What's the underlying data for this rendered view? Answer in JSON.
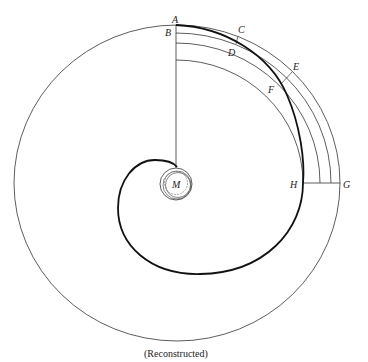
{
  "figure": {
    "caption": "(Reconstructed)",
    "labels": {
      "A": "A",
      "B": "B",
      "C": "C",
      "D": "D",
      "E": "E",
      "F": "F",
      "G": "G",
      "H": "H",
      "M": "M"
    },
    "colors": {
      "stroke": "#222222",
      "background": "#ffffff"
    }
  }
}
